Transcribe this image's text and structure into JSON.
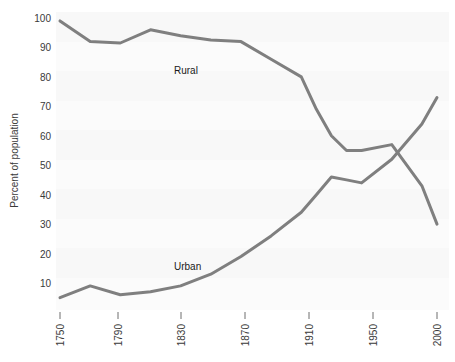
{
  "chart_data": {
    "type": "line",
    "title": "",
    "subtitle": "",
    "xlabel": "",
    "ylabel": "Percent of population",
    "xlim": [
      1750,
      2000
    ],
    "ylim": [
      0,
      100
    ],
    "xticks": [
      1750,
      1790,
      1830,
      1870,
      1910,
      1950,
      2000
    ],
    "xtick_labels": [
      "1750",
      "1790",
      "1830",
      "1870",
      "1910",
      "1950",
      "2000"
    ],
    "yticks": [
      10,
      20,
      30,
      40,
      50,
      60,
      70,
      80,
      90,
      100
    ],
    "ytick_labels": [
      "10",
      "20",
      "30",
      "40",
      "50",
      "60",
      "70",
      "80",
      "90",
      "100"
    ],
    "grid": false,
    "legend_position": "inline-annotation",
    "line_color": "#7f7f7f",
    "line_width": 3,
    "plot_background": "#fbfbfb",
    "series": [
      {
        "name": "Rural",
        "label": "Rural",
        "label_x": 1835,
        "label_y": 84,
        "x": [
          1750,
          1770,
          1790,
          1810,
          1830,
          1850,
          1870,
          1890,
          1910,
          1920,
          1930,
          1940,
          1950,
          1970,
          1990,
          2000
        ],
        "values": [
          99,
          92,
          91.5,
          96,
          94,
          92.5,
          92,
          86,
          80,
          69,
          60,
          55,
          55,
          57,
          43,
          30
        ]
      },
      {
        "name": "Urban",
        "label": "Urban",
        "label_x": 1830,
        "label_y": 15,
        "x": [
          1750,
          1770,
          1790,
          1810,
          1830,
          1850,
          1870,
          1890,
          1910,
          1920,
          1930,
          1940,
          1950,
          1970,
          1990,
          2000
        ],
        "values": [
          5,
          9,
          6,
          7,
          9,
          13,
          19,
          26,
          34,
          40,
          46,
          45,
          44,
          52,
          64,
          73
        ]
      }
    ],
    "annotations": [
      {
        "text": "Rural",
        "x": 1835,
        "y": 84
      },
      {
        "text": "Urban",
        "x": 1830,
        "y": 15
      }
    ]
  },
  "series_points": {
    "rural_px": "99,18 | 92,39 | 96,31 | 94,38 | 92,47 | 80,70 | 55,153 | 57,148 | 30,222 | 23,248",
    "urban_px": "5,292 | 9,280 | 6,293 | 9,283 | 19,252 | 34,205 | 46,176 | 44,185 | 64,107 | 73,89"
  }
}
